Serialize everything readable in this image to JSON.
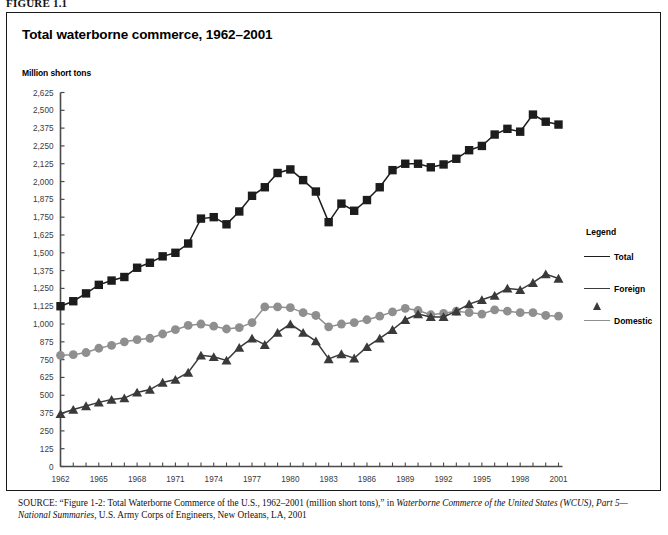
{
  "figure": {
    "label": "FIGURE 1.1",
    "title": "Total waterborne commerce, 1962–2001",
    "axis_unit_label": "Million short tons"
  },
  "legend": {
    "title": "Legend",
    "items": [
      {
        "label": "Total",
        "marker": "square-marker",
        "color": "#1c1c1c"
      },
      {
        "label": "Foreign",
        "marker": "triangle-marker",
        "color": "#3a3a3a"
      },
      {
        "label": "Domestic",
        "marker": "circle-marker",
        "color": "#8f8f8f"
      }
    ]
  },
  "source": {
    "lead": "SOURCE:",
    "text_1": " “Figure 1-2: Total Waterborne Commerce of the U.S., 1962–2001 (million short tons),” in ",
    "italic_1": "Waterborne Commerce of the United States (WCUS), Part 5—National Summaries,",
    "text_2": " U.S. Army Corps of Engineers, New Orleans, LA, 2001"
  },
  "chart_data": {
    "type": "line",
    "title": "Total waterborne commerce, 1962–2001",
    "xlabel": "",
    "ylabel": "Million short tons",
    "ylim": [
      0,
      2625
    ],
    "ytick_step": 125,
    "ytick_labels": [
      "0",
      "125",
      "250",
      "375",
      "500",
      "625",
      "750",
      "875",
      "1,000",
      "1,125",
      "1,250",
      "1,375",
      "1,500",
      "1,625",
      "1,750",
      "1,875",
      "2,000",
      "2,125",
      "2,250",
      "2,375",
      "2,500",
      "2,625"
    ],
    "ytick_values": [
      0,
      125,
      250,
      375,
      500,
      625,
      750,
      875,
      1000,
      1125,
      1250,
      1375,
      1500,
      1625,
      1750,
      1875,
      2000,
      2125,
      2250,
      2375,
      2500,
      2625
    ],
    "xlim": [
      1962,
      2001
    ],
    "xtick_labels": [
      "1962",
      "1965",
      "1968",
      "1971",
      "1974",
      "1977",
      "1980",
      "1983",
      "1986",
      "1989",
      "1992",
      "1995",
      "1998",
      "2001"
    ],
    "xtick_values": [
      1962,
      1965,
      1968,
      1971,
      1974,
      1977,
      1980,
      1983,
      1986,
      1989,
      1992,
      1995,
      1998,
      2001
    ],
    "grid": false,
    "legend_position": "right",
    "x": [
      1962,
      1963,
      1964,
      1965,
      1966,
      1967,
      1968,
      1969,
      1970,
      1971,
      1972,
      1973,
      1974,
      1975,
      1976,
      1977,
      1978,
      1979,
      1980,
      1981,
      1982,
      1983,
      1984,
      1985,
      1986,
      1987,
      1988,
      1989,
      1990,
      1991,
      1992,
      1993,
      1994,
      1995,
      1996,
      1997,
      1998,
      1999,
      2000,
      2001
    ],
    "series": [
      {
        "name": "Total",
        "marker": "square-marker",
        "color": "#1c1c1c",
        "values": [
          1125,
          1160,
          1215,
          1275,
          1305,
          1330,
          1395,
          1430,
          1475,
          1500,
          1565,
          1740,
          1750,
          1700,
          1790,
          1900,
          1960,
          2060,
          2085,
          2010,
          1930,
          1715,
          1845,
          1795,
          1870,
          1960,
          2080,
          2125,
          2125,
          2100,
          2120,
          2160,
          2220,
          2250,
          2330,
          2370,
          2350,
          2470,
          2420,
          2400
        ]
      },
      {
        "name": "Foreign",
        "marker": "triangle-marker",
        "color": "#3a3a3a",
        "values": [
          370,
          400,
          425,
          450,
          470,
          480,
          520,
          540,
          590,
          610,
          660,
          780,
          770,
          745,
          835,
          900,
          855,
          940,
          1000,
          940,
          880,
          755,
          790,
          760,
          840,
          900,
          960,
          1030,
          1070,
          1050,
          1050,
          1090,
          1140,
          1170,
          1200,
          1250,
          1240,
          1290,
          1350,
          1320
        ]
      },
      {
        "name": "Domestic",
        "marker": "circle-marker",
        "color": "#8f8f8f",
        "values": [
          780,
          785,
          800,
          830,
          850,
          875,
          890,
          900,
          930,
          960,
          990,
          1000,
          985,
          965,
          975,
          1010,
          1120,
          1120,
          1115,
          1080,
          1060,
          980,
          1000,
          1010,
          1030,
          1055,
          1085,
          1110,
          1095,
          1065,
          1075,
          1090,
          1080,
          1070,
          1100,
          1090,
          1080,
          1080,
          1060,
          1055
        ]
      }
    ]
  }
}
